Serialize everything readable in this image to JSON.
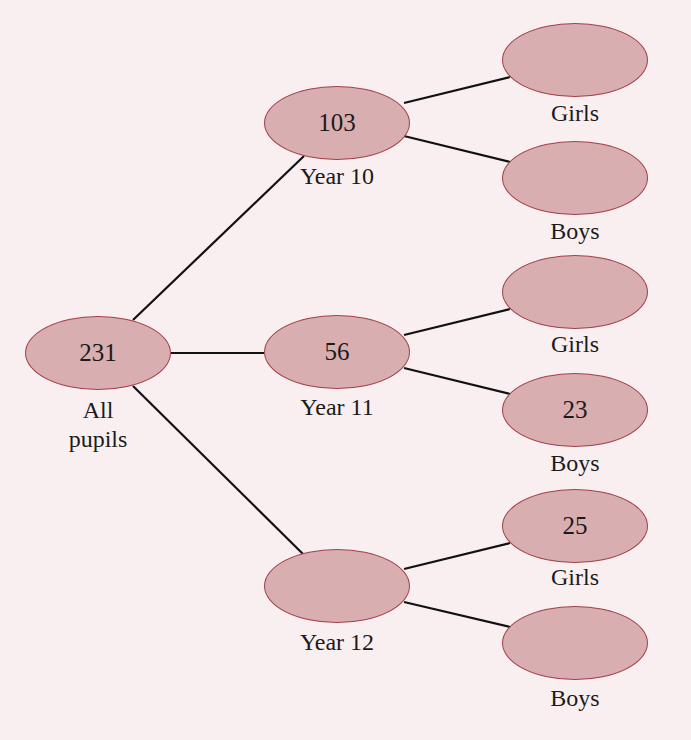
{
  "colors": {
    "background": "#f9eff0",
    "node_fill": "#d8aeb0",
    "node_border": "#a4414a",
    "line": "#111111"
  },
  "root": {
    "value": "231",
    "label_line1": "All",
    "label_line2": "pupils"
  },
  "years": [
    {
      "value": "103",
      "label": "Year 10",
      "girls": {
        "value": "",
        "label": "Girls"
      },
      "boys": {
        "value": "",
        "label": "Boys"
      }
    },
    {
      "value": "56",
      "label": "Year 11",
      "girls": {
        "value": "",
        "label": "Girls"
      },
      "boys": {
        "value": "23",
        "label": "Boys"
      }
    },
    {
      "value": "",
      "label": "Year 12",
      "girls": {
        "value": "25",
        "label": "Girls"
      },
      "boys": {
        "value": "",
        "label": "Boys"
      }
    }
  ]
}
